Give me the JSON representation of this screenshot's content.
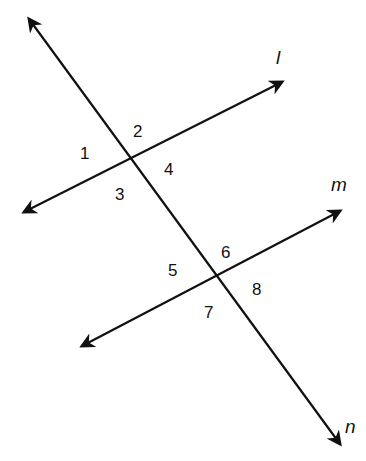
{
  "diagram": {
    "lines": [
      {
        "name": "l",
        "label": "l"
      },
      {
        "name": "m",
        "label": "m"
      },
      {
        "name": "n",
        "label": "n"
      }
    ],
    "angles": [
      {
        "id": "1",
        "label": "1"
      },
      {
        "id": "2",
        "label": "2"
      },
      {
        "id": "3",
        "label": "3"
      },
      {
        "id": "4",
        "label": "4"
      },
      {
        "id": "5",
        "label": "5"
      },
      {
        "id": "6",
        "label": "6"
      },
      {
        "id": "7",
        "label": "7"
      },
      {
        "id": "8",
        "label": "8"
      }
    ],
    "colors": {
      "stroke": "#111111",
      "background": "#ffffff"
    }
  }
}
